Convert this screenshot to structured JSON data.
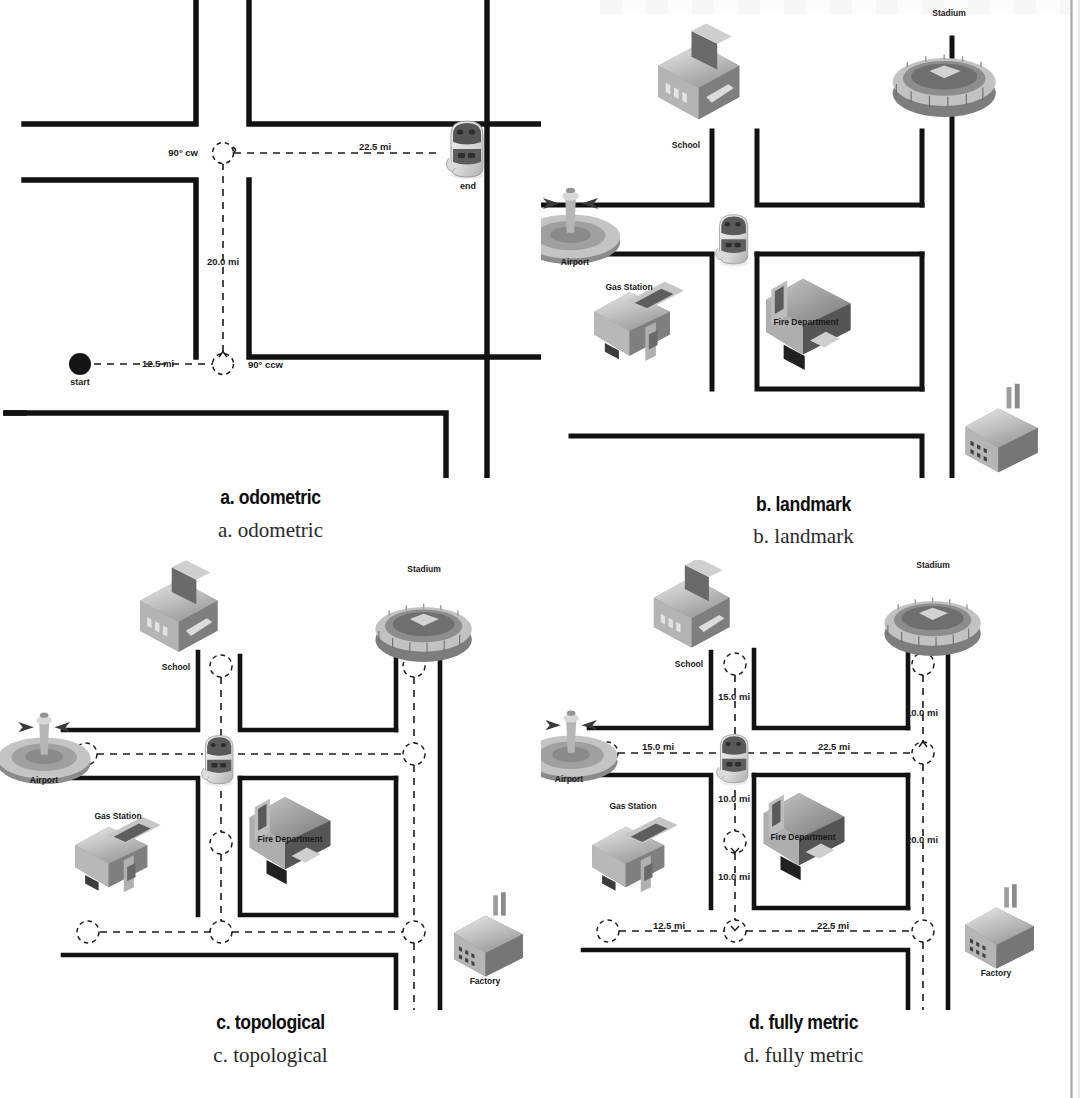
{
  "figure": {
    "panel_count": 4
  },
  "panels": {
    "a": {
      "key": "a",
      "caption_bold": "a. odometric",
      "caption_serif": "a. odometric",
      "start_label": "start",
      "end_label": "end",
      "edges": [
        {
          "label": "12.5 mi",
          "orientation": "horizontal"
        },
        {
          "label": "20.0 mi",
          "orientation": "vertical"
        },
        {
          "label": "22.5 mi",
          "orientation": "horizontal"
        }
      ],
      "turns": [
        {
          "label": "90° ccw"
        },
        {
          "label": "90° cw"
        }
      ]
    },
    "b": {
      "key": "b",
      "caption_bold": "b. landmark",
      "caption_serif": "b. landmark",
      "landmarks": [
        {
          "name": "School",
          "icon": "school-icon"
        },
        {
          "name": "Stadium",
          "icon": "stadium-icon"
        },
        {
          "name": "Airport",
          "icon": "airport-icon"
        },
        {
          "name": "Gas Station",
          "icon": "gas-station-icon"
        },
        {
          "name": "Fire Department",
          "icon": "fire-department-icon"
        },
        {
          "name": "Factory",
          "icon": "factory-icon"
        }
      ]
    },
    "c": {
      "key": "c",
      "caption_bold": "c. topological",
      "caption_serif": "c. topological",
      "landmarks": [
        {
          "name": "School",
          "icon": "school-icon"
        },
        {
          "name": "Stadium",
          "icon": "stadium-icon"
        },
        {
          "name": "Airport",
          "icon": "airport-icon"
        },
        {
          "name": "Gas Station",
          "icon": "gas-station-icon"
        },
        {
          "name": "Fire Department",
          "icon": "fire-department-icon"
        },
        {
          "name": "Factory",
          "icon": "factory-icon"
        }
      ],
      "node_count": 9
    },
    "d": {
      "key": "d",
      "caption_bold": "d. fully  metric",
      "caption_serif": "d. fully metric",
      "landmarks": [
        {
          "name": "School",
          "icon": "school-icon"
        },
        {
          "name": "Stadium",
          "icon": "stadium-icon"
        },
        {
          "name": "Airport",
          "icon": "airport-icon"
        },
        {
          "name": "Gas Station",
          "icon": "gas-station-icon"
        },
        {
          "name": "Fire Department",
          "icon": "fire-department-icon"
        },
        {
          "name": "Factory",
          "icon": "factory-icon"
        }
      ],
      "edges": [
        {
          "id": "school-to-center",
          "label": "15.0 mi",
          "orientation": "vertical"
        },
        {
          "id": "stadium-to-east",
          "label": "10.0 mi",
          "orientation": "vertical"
        },
        {
          "id": "airport-to-center",
          "label": "15.0 mi",
          "orientation": "horizontal"
        },
        {
          "id": "center-to-east",
          "label": "22.5 mi",
          "orientation": "horizontal"
        },
        {
          "id": "center-to-mid",
          "label": "10.0 mi",
          "orientation": "vertical"
        },
        {
          "id": "mid-to-south",
          "label": "10.0 mi",
          "orientation": "vertical"
        },
        {
          "id": "east-to-southeast",
          "label": "20.0 mi",
          "orientation": "vertical"
        },
        {
          "id": "southwest-to-south",
          "label": "12.5 mi",
          "orientation": "horizontal"
        },
        {
          "id": "south-to-southeast",
          "label": "22.5 mi",
          "orientation": "horizontal"
        }
      ]
    }
  },
  "colors": {
    "road": "#121212",
    "dash": "#1b1b1b",
    "text": "#1a1a1a",
    "paper": "#fefefe",
    "icon_light": "#d9d9d9",
    "icon_mid": "#a8a8a8",
    "icon_dark": "#6e6e6e",
    "icon_darkest": "#3f3f3f"
  }
}
